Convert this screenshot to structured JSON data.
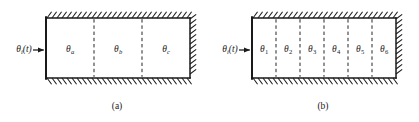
{
  "figure": {
    "type": "engineering-diagram",
    "background_color": "#ffffff",
    "line_color": "#1a1a1a",
    "hatch_color": "#1a1a1a"
  },
  "panels": [
    {
      "id": "panel-a",
      "caption": "(a)",
      "caption_x": 117,
      "caption_y": 101,
      "input": {
        "label_theta": "θ",
        "label_subscript": "i",
        "label_suffix": "(t)",
        "label_x": 24,
        "label_y": 50,
        "arrow": {
          "name": "input-heat-flow-arrow",
          "x1": 33,
          "x2": 45,
          "y": 50
        }
      },
      "box": {
        "x": 46,
        "y": 18,
        "width": 144,
        "height": 60
      },
      "walls": {
        "left": "plain",
        "top": "hatched",
        "right": "hatched",
        "bottom": "hatched"
      },
      "dividers": [
        94,
        142
      ],
      "cells": [
        {
          "label_theta": "θ",
          "subscript": "a",
          "subscript_style": "italic",
          "cx": 70,
          "cy": 50
        },
        {
          "label_theta": "θ",
          "subscript": "b",
          "subscript_style": "italic",
          "cx": 118,
          "cy": 50
        },
        {
          "label_theta": "θ",
          "subscript": "c",
          "subscript_style": "italic",
          "cx": 166,
          "cy": 50
        }
      ]
    },
    {
      "id": "panel-b",
      "caption": "(b)",
      "caption_x": 323,
      "caption_y": 101,
      "input": {
        "label_theta": "θ",
        "label_subscript": "i",
        "label_suffix": "(t)",
        "label_x": 230,
        "label_y": 50,
        "arrow": {
          "name": "input-heat-flow-arrow",
          "x1": 239,
          "x2": 251,
          "y": 50
        }
      },
      "box": {
        "x": 252,
        "y": 18,
        "width": 144,
        "height": 60
      },
      "walls": {
        "left": "plain",
        "top": "hatched",
        "right": "hatched",
        "bottom": "hatched"
      },
      "dividers": [
        276,
        300,
        324,
        348,
        372
      ],
      "cells": [
        {
          "label_theta": "θ",
          "subscript": "1",
          "subscript_style": "roman",
          "cx": 264,
          "cy": 50
        },
        {
          "label_theta": "θ",
          "subscript": "2",
          "subscript_style": "roman",
          "cx": 288,
          "cy": 50
        },
        {
          "label_theta": "θ",
          "subscript": "3",
          "subscript_style": "roman",
          "cx": 312,
          "cy": 50
        },
        {
          "label_theta": "θ",
          "subscript": "4",
          "subscript_style": "roman",
          "cx": 336,
          "cy": 50
        },
        {
          "label_theta": "θ",
          "subscript": "5",
          "subscript_style": "roman",
          "cx": 360,
          "cy": 50
        },
        {
          "label_theta": "θ",
          "subscript": "6",
          "subscript_style": "roman",
          "cx": 384,
          "cy": 50
        }
      ]
    }
  ]
}
